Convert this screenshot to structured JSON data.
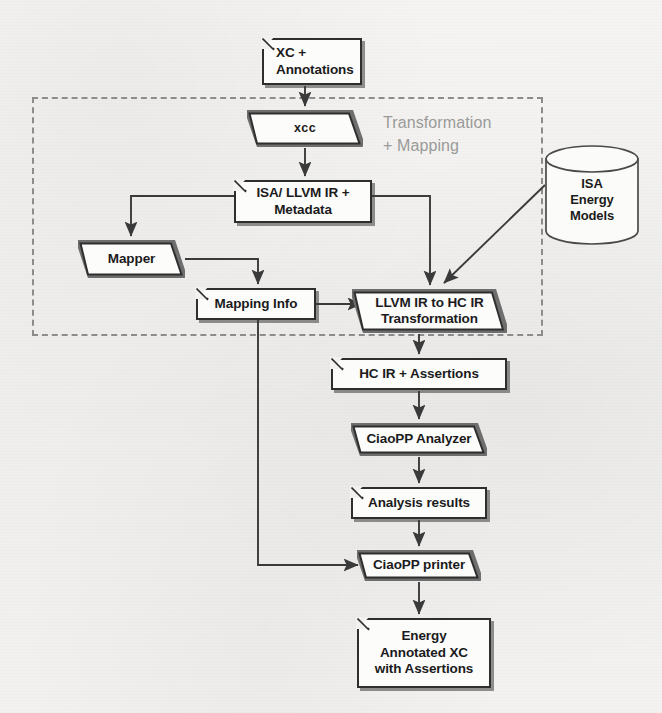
{
  "diagram": {
    "group": {
      "name": "transformation-mapping-group",
      "label": "Transformation\n+ Mapping",
      "label_color": "#9a9a9a",
      "border_style": "dashed",
      "border_color": "#8c8c8c"
    },
    "nodes": [
      {
        "id": "xc-annotations",
        "label": "XC +\nAnnotations",
        "shape": "note",
        "x": 262,
        "y": 38,
        "w": 100,
        "h": 47
      },
      {
        "id": "xcc",
        "label": "xcc",
        "shape": "parallelogram",
        "x": 247,
        "y": 110,
        "w": 116,
        "h": 37
      },
      {
        "id": "isa-llvm-ir-metadata",
        "label": "ISA/ LLVM IR +\nMetadata",
        "shape": "note",
        "x": 234,
        "y": 180,
        "w": 138,
        "h": 43
      },
      {
        "id": "mapper",
        "label": "Mapper",
        "shape": "parallelogram",
        "x": 78,
        "y": 240,
        "w": 107,
        "h": 38
      },
      {
        "id": "mapping-info",
        "label": "Mapping Info",
        "shape": "note",
        "x": 196,
        "y": 288,
        "w": 120,
        "h": 32
      },
      {
        "id": "llvm-to-hc-transform",
        "label": "LLVM IR to HC IR\nTransformation",
        "shape": "parallelogram",
        "x": 352,
        "y": 289,
        "w": 155,
        "h": 44
      },
      {
        "id": "hc-ir-assertions",
        "label": "HC IR + Assertions",
        "shape": "note",
        "x": 331,
        "y": 358,
        "w": 176,
        "h": 32
      },
      {
        "id": "ciaopp-analyzer",
        "label": "CiaoPP Analyzer",
        "shape": "parallelogram",
        "x": 351,
        "y": 423,
        "w": 136,
        "h": 33
      },
      {
        "id": "analysis-results",
        "label": "Analysis results",
        "shape": "note",
        "x": 351,
        "y": 487,
        "w": 136,
        "h": 32
      },
      {
        "id": "ciaopp-printer",
        "label": "CiaoPP printer",
        "shape": "parallelogram",
        "x": 357,
        "y": 550,
        "w": 124,
        "h": 31
      },
      {
        "id": "energy-annotated-xc",
        "label": "Energy\nAnnotated XC\nwith Assertions",
        "shape": "note",
        "x": 357,
        "y": 618,
        "w": 134,
        "h": 70
      },
      {
        "id": "isa-energy-models",
        "label": "ISA\nEnergy\nModels",
        "shape": "cylinder",
        "x": 544,
        "y": 145,
        "w": 96,
        "h": 100
      }
    ],
    "edges": [
      {
        "from": "xc-annotations",
        "to": "xcc",
        "name": "edge-xc-to-xcc"
      },
      {
        "from": "xcc",
        "to": "isa-llvm-ir-metadata",
        "name": "edge-xcc-to-isa-llvm"
      },
      {
        "from": "isa-llvm-ir-metadata",
        "to": "mapper",
        "name": "edge-isa-llvm-to-mapper"
      },
      {
        "from": "isa-llvm-ir-metadata",
        "to": "llvm-to-hc-transform",
        "name": "edge-isa-llvm-to-transform"
      },
      {
        "from": "mapper",
        "to": "mapping-info",
        "name": "edge-mapper-to-mapping-info"
      },
      {
        "from": "mapping-info",
        "to": "llvm-to-hc-transform",
        "name": "edge-mapping-info-to-transform"
      },
      {
        "from": "mapping-info",
        "to": "ciaopp-printer",
        "name": "edge-mapping-info-to-printer"
      },
      {
        "from": "isa-energy-models",
        "to": "llvm-to-hc-transform",
        "name": "edge-energy-models-to-transform"
      },
      {
        "from": "llvm-to-hc-transform",
        "to": "hc-ir-assertions",
        "name": "edge-transform-to-hc-ir"
      },
      {
        "from": "hc-ir-assertions",
        "to": "ciaopp-analyzer",
        "name": "edge-hc-ir-to-analyzer"
      },
      {
        "from": "ciaopp-analyzer",
        "to": "analysis-results",
        "name": "edge-analyzer-to-results"
      },
      {
        "from": "analysis-results",
        "to": "ciaopp-printer",
        "name": "edge-results-to-printer"
      },
      {
        "from": "ciaopp-printer",
        "to": "energy-annotated-xc",
        "name": "edge-printer-to-energy-xc"
      }
    ],
    "colors": {
      "background": "#f2f1ef",
      "node_stroke": "#2e2e2e",
      "node_fill": "#fcfcfb",
      "edge_stroke": "#3a3a3a",
      "group_stroke": "#8c8c8c",
      "group_text": "#9a9a9a",
      "text": "#1b1b1b"
    }
  }
}
